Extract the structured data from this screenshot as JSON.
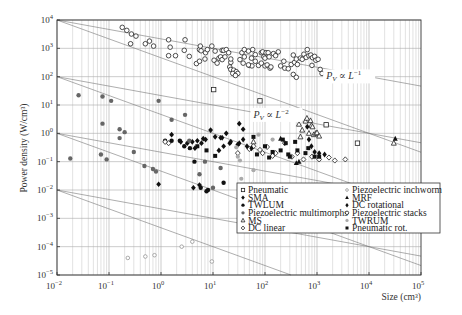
{
  "chart_data": {
    "type": "scatter",
    "title": "",
    "xlabel": "Size (cm³)",
    "ylabel": "Power density (W/cm³)",
    "xscale": "log",
    "yscale": "log",
    "xlim": [
      0.01,
      100000
    ],
    "ylim": [
      1e-05,
      10000
    ],
    "x_ticks": [
      "10^-2",
      "10^-1",
      "10^0",
      "10^1",
      "10^2",
      "10^3",
      "10^4",
      "10^5"
    ],
    "y_ticks": [
      "10^4",
      "10^3",
      "10^2",
      "10^1",
      "10^0",
      "10^-1",
      "10^-2",
      "10^-3",
      "10^-4",
      "10^-5"
    ],
    "grid": true,
    "annotations": [
      {
        "text_main": "P",
        "text_sub": "V",
        "text_rel": " ∝ L",
        "text_exp": "−1",
        "x": 1500,
        "y": 80
      },
      {
        "text_main": "P",
        "text_sub": "V",
        "text_rel": " ∝ L",
        "text_exp": "−2",
        "x": 60,
        "y": 3.5
      }
    ],
    "reference_lines": [
      {
        "slope_decades": -0.3333,
        "x0": 0.01,
        "y0": 10000
      },
      {
        "slope_decades": -0.6667,
        "x0": 0.01,
        "y0": 10000
      },
      {
        "slope_decades": -0.3333,
        "x0": 0.01,
        "y0": 100
      },
      {
        "slope_decades": -0.6667,
        "x0": 0.01,
        "y0": 100
      },
      {
        "slope_decades": -0.3333,
        "x0": 0.01,
        "y0": 1
      },
      {
        "slope_decades": -0.6667,
        "x0": 0.01,
        "y0": 1
      },
      {
        "slope_decades": -0.3333,
        "x0": 0.01,
        "y0": 0.01
      },
      {
        "slope_decades": -0.6667,
        "x0": 0.01,
        "y0": 0.01
      }
    ],
    "legend_position": "lower right",
    "series": [
      {
        "name": "Pneumatic",
        "marker": "open-square",
        "points": [
          [
            10.3,
            35
          ],
          [
            80,
            14
          ],
          [
            350,
            3.6
          ],
          [
            1500,
            2.0
          ],
          [
            6000,
            0.45
          ],
          [
            170,
            0.006
          ]
        ]
      },
      {
        "name": "SMA",
        "marker": "filled-diamond",
        "points": [
          [
            1.6,
            0.9
          ],
          [
            2.4,
            0.5
          ],
          [
            3.2,
            0.45
          ],
          [
            4.0,
            0.5
          ],
          [
            4.5,
            0.3
          ],
          [
            5.0,
            0.55
          ],
          [
            6.0,
            0.45
          ],
          [
            6.5,
            0.65
          ],
          [
            7.2,
            0.6
          ],
          [
            9.0,
            1.3
          ],
          [
            11,
            0.75
          ],
          [
            14,
            0.7
          ],
          [
            16,
            0.35
          ],
          [
            18,
            1.0
          ],
          [
            21,
            0.45
          ],
          [
            30,
            0.4
          ],
          [
            32,
            2.2
          ],
          [
            38,
            1.4
          ],
          [
            13,
            0.25
          ],
          [
            4.2,
            0.012
          ],
          [
            5.5,
            0.015
          ],
          [
            0.9,
            0.016
          ]
        ]
      },
      {
        "name": "TWLUM",
        "marker": "filled-circle",
        "points": [
          [
            1.2,
            0.55
          ],
          [
            1.6,
            0.55
          ],
          [
            2.3,
            0.55
          ],
          [
            2.8,
            0.35
          ],
          [
            3.6,
            0.3
          ],
          [
            4.4,
            0.1
          ],
          [
            5.8,
            0.012
          ],
          [
            7.5,
            0.009
          ],
          [
            8.0,
            0.01
          ],
          [
            16,
            0.018
          ]
        ]
      },
      {
        "name": "Piezoelectric multimorphs",
        "marker": "gray-filled-circle",
        "points": [
          [
            0.026,
            22
          ],
          [
            0.075,
            20
          ],
          [
            0.11,
            14
          ],
          [
            0.018,
            0.13
          ],
          [
            0.07,
            0.18
          ],
          [
            0.075,
            2.2
          ],
          [
            0.16,
            1.4
          ],
          [
            0.2,
            1.1
          ],
          [
            0.16,
            0.68
          ],
          [
            0.3,
            0.22
          ],
          [
            0.09,
            0.12
          ],
          [
            0.7,
            0.055
          ],
          [
            0.48,
            0.07
          ],
          [
            0.8,
            0.045
          ],
          [
            1.6,
            3.0
          ],
          [
            3.5,
            0.55
          ],
          [
            5.5,
            0.036
          ],
          [
            7.0,
            0.1
          ],
          [
            10,
            0.012
          ],
          [
            14,
            0.06
          ],
          [
            0.9,
            14
          ],
          [
            2.9,
            4.5
          ]
        ]
      },
      {
        "name": "MS",
        "marker": "open-triangle",
        "points": [
          [
            450,
            2.1
          ],
          [
            520,
            1.3
          ],
          [
            600,
            2.7
          ],
          [
            640,
            3.4
          ],
          [
            700,
            1.0
          ],
          [
            750,
            2.8
          ],
          [
            780,
            1.9
          ],
          [
            820,
            1.7
          ],
          [
            870,
            0.9
          ],
          [
            950,
            1.0
          ],
          [
            1000,
            1.05
          ],
          [
            1100,
            0.8
          ],
          [
            480,
            0.75
          ],
          [
            60,
            0.5
          ],
          [
            30000,
            0.45
          ]
        ]
      },
      {
        "name": "DC linear",
        "marker": "open-diamond",
        "points": [
          [
            1.4,
            0.45
          ],
          [
            1.2,
            0.5
          ],
          [
            50,
            0.28
          ],
          [
            60,
            0.35
          ],
          [
            80,
            0.26
          ],
          [
            90,
            0.2
          ],
          [
            110,
            0.33
          ],
          [
            140,
            0.16
          ],
          [
            160,
            0.2
          ],
          [
            240,
            0.45
          ],
          [
            330,
            0.15
          ],
          [
            420,
            0.2
          ],
          [
            550,
            0.12
          ],
          [
            800,
            0.15
          ],
          [
            1100,
            0.12
          ],
          [
            1700,
            0.14
          ],
          [
            2200,
            0.11
          ],
          [
            3500,
            0.12
          ],
          [
            30,
            0.2
          ],
          [
            70,
            0.0055
          ],
          [
            110,
            0.003
          ],
          [
            140,
            0.0025
          ]
        ]
      },
      {
        "name": "Piezoelectric inchworm",
        "marker": "small-open-circle",
        "points": [
          [
            0.23,
            4e-05
          ],
          [
            0.5,
            4.5e-05
          ],
          [
            0.75,
            5e-05
          ],
          [
            2.5,
            0.0001
          ],
          [
            4.0,
            0.00015
          ],
          [
            9.5,
            3e-05
          ]
        ]
      },
      {
        "name": "MRF",
        "marker": "filled-triangle",
        "points": [
          [
            200,
            0.65
          ],
          [
            32000,
            0.65
          ],
          [
            400,
            0.09
          ],
          [
            450,
            0.1
          ]
        ]
      },
      {
        "name": "DC rotational",
        "marker": "filled-diamond-small",
        "points": [
          [
            15,
            0.7
          ],
          [
            22,
            0.5
          ],
          [
            32,
            0.45
          ],
          [
            38,
            0.6
          ],
          [
            45,
            0.35
          ],
          [
            55,
            0.3
          ],
          [
            650,
            1.7
          ],
          [
            700,
            0.6
          ],
          [
            780,
            0.35
          ],
          [
            900,
            0.22
          ],
          [
            1100,
            0.2
          ],
          [
            1400,
            0.18
          ]
        ]
      },
      {
        "name": "Piezoelectric stacks",
        "marker": "open-circle",
        "points": [
          [
            0.18,
            5500
          ],
          [
            0.22,
            4300
          ],
          [
            0.27,
            3200
          ],
          [
            0.33,
            2700
          ],
          [
            0.26,
            1450
          ],
          [
            0.5,
            1450
          ],
          [
            0.6,
            1800
          ],
          [
            0.72,
            1200
          ],
          [
            1.4,
            2000
          ],
          [
            1.5,
            1100
          ],
          [
            1.4,
            550
          ],
          [
            1.9,
            550
          ],
          [
            2.9,
            2000
          ],
          [
            2.8,
            850
          ],
          [
            3.5,
            520
          ],
          [
            5.5,
            900
          ],
          [
            5.7,
            1200
          ],
          [
            5.9,
            820
          ],
          [
            4.8,
            290
          ],
          [
            5.5,
            350
          ],
          [
            7.0,
            420
          ],
          [
            7.2,
            700
          ],
          [
            7.8,
            900
          ],
          [
            9.5,
            1200
          ],
          [
            10.5,
            380
          ],
          [
            11,
            800
          ],
          [
            12,
            300
          ],
          [
            13,
            450
          ],
          [
            14,
            500
          ],
          [
            15,
            400
          ],
          [
            15,
            850
          ],
          [
            16,
            850
          ],
          [
            18,
            900
          ],
          [
            17,
            500
          ],
          [
            20,
            700
          ],
          [
            22,
            320
          ],
          [
            22,
            420
          ],
          [
            21,
            220
          ],
          [
            22,
            180
          ],
          [
            25,
            170
          ],
          [
            28,
            150
          ],
          [
            30,
            130
          ],
          [
            24,
            130
          ],
          [
            27,
            110
          ],
          [
            33,
            400
          ],
          [
            36,
            700
          ],
          [
            40,
            500
          ],
          [
            38,
            300
          ],
          [
            40,
            900
          ],
          [
            48,
            800
          ],
          [
            50,
            250
          ],
          [
            55,
            450
          ],
          [
            56,
            240
          ],
          [
            48,
            260
          ],
          [
            58,
            900
          ],
          [
            65,
            600
          ],
          [
            65,
            350
          ],
          [
            75,
            250
          ],
          [
            85,
            700
          ],
          [
            90,
            750
          ],
          [
            95,
            500
          ],
          [
            100,
            450
          ],
          [
            85,
            300
          ],
          [
            105,
            700
          ],
          [
            100,
            240
          ],
          [
            110,
            260
          ],
          [
            115,
            700
          ],
          [
            120,
            500
          ],
          [
            125,
            200
          ],
          [
            130,
            220
          ],
          [
            145,
            650
          ],
          [
            160,
            550
          ],
          [
            180,
            750
          ],
          [
            200,
            240
          ],
          [
            230,
            350
          ],
          [
            240,
            200
          ],
          [
            280,
            190
          ],
          [
            320,
            270
          ],
          [
            370,
            320
          ],
          [
            400,
            420
          ],
          [
            350,
            120
          ],
          [
            400,
            95
          ],
          [
            350,
            580
          ],
          [
            420,
            270
          ],
          [
            480,
            450
          ],
          [
            520,
            410
          ],
          [
            560,
            620
          ],
          [
            620,
            480
          ],
          [
            650,
            900
          ],
          [
            700,
            550
          ],
          [
            760,
            580
          ],
          [
            820,
            470
          ],
          [
            800,
            250
          ],
          [
            900,
            520
          ],
          [
            950,
            380
          ],
          [
            1050,
            410
          ],
          [
            1150,
            180
          ],
          [
            1250,
            130
          ]
        ]
      },
      {
        "name": "TWRUM",
        "marker": "light-gray-filled-circle",
        "points": [
          [
            28,
            0.32
          ],
          [
            30,
            0.15
          ],
          [
            33,
            0.11
          ],
          [
            35,
            0.025
          ],
          [
            60,
            0.05
          ],
          [
            75,
            0.9
          ],
          [
            100,
            0.015
          ],
          [
            140,
            0.6
          ],
          [
            320,
            0.16
          ]
        ]
      },
      {
        "name": "Pneumatic rot.",
        "marker": "filled-square",
        "points": [
          [
            5.0,
            0.35
          ],
          [
            7.5,
            0.25
          ],
          [
            11,
            0.16
          ],
          [
            60,
            0.75
          ],
          [
            70,
            0.18
          ],
          [
            100,
            0.35
          ],
          [
            120,
            0.14
          ],
          [
            140,
            0.22
          ],
          [
            200,
            0.25
          ],
          [
            220,
            0.6
          ],
          [
            250,
            0.45
          ],
          [
            280,
            0.18
          ],
          [
            300,
            0.15
          ],
          [
            380,
            0.5
          ],
          [
            420,
            0.25
          ],
          [
            600,
            0.2
          ],
          [
            680,
            0.3
          ],
          [
            900,
            0.15
          ],
          [
            1100,
            0.15
          ]
        ]
      }
    ]
  }
}
